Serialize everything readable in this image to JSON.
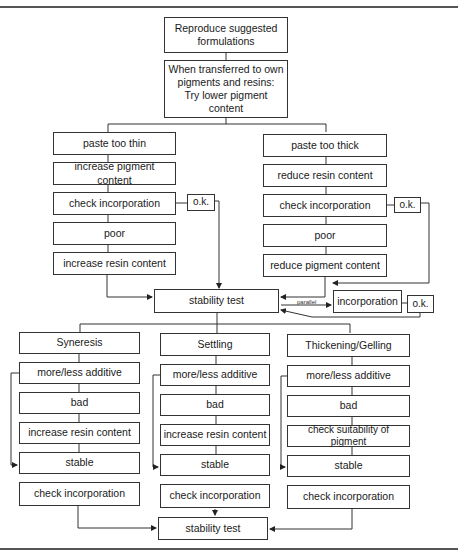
{
  "diagram": {
    "top": {
      "reproduce": "Reproduce suggested\nformulations",
      "transfer": "When transferred to own\npigments and resins:\nTry lower pigment\ncontent"
    },
    "left_branch": {
      "steps": [
        "paste too thin",
        "increase pigment content",
        "check incorporation",
        "poor",
        "increase resin content"
      ],
      "ok": "o.k."
    },
    "right_branch": {
      "steps": [
        "paste too thick",
        "reduce resin content",
        "check incorporation",
        "poor",
        "reduce pigment content"
      ],
      "ok": "o.k."
    },
    "middle": {
      "stability_test": "stability test",
      "parallel_label": "parallel",
      "incorporation": "incorporation",
      "ok": "o.k."
    },
    "columns": [
      {
        "title": "Syneresis",
        "steps": [
          "more/less additive",
          "bad",
          "increase resin content",
          "stable",
          "check incorporation"
        ]
      },
      {
        "title": "Settling",
        "steps": [
          "more/less additive",
          "bad",
          "increase resin content",
          "stable",
          "check incorporation"
        ]
      },
      {
        "title": "Thickening/Gelling",
        "steps": [
          "more/less additive",
          "bad",
          "check suitability of pigment",
          "stable",
          "check incorporation"
        ]
      }
    ],
    "final": {
      "stability_test": "stability test"
    }
  }
}
